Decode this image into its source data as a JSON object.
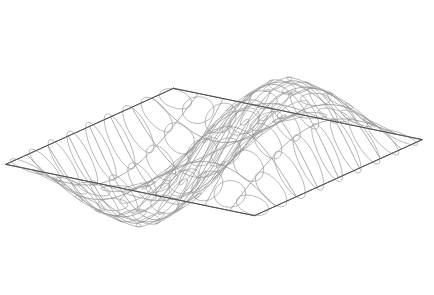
{
  "figure": {
    "title": "",
    "caption": "",
    "background_color": "#ffffff",
    "grid_stroke_color": "#8a8a8a",
    "boundary_stroke_color": "#4a4a4a",
    "ellipse_stroke_color": "#9a9a9a",
    "width": 434,
    "height": 295
  },
  "chart_data": {
    "type": "line",
    "title": "",
    "subtitle": "",
    "xlabel": "",
    "ylabel": "",
    "zlabel": "",
    "render_style": "wireframe-surface-with-curvature-ellipses",
    "surface": {
      "name": "sinusoidal saddle wave surface",
      "equation": "z = A * sin(pi * u) * cos(pi * v * 0.5)",
      "amplitude": 1.0,
      "u_range": [
        -1,
        1
      ],
      "v_range": [
        -1,
        1
      ],
      "u_divisions": 11,
      "v_divisions": 9
    },
    "projection": {
      "type": "axonometric",
      "azimuth_deg": 34,
      "elevation_deg": 21,
      "scale_x": 150,
      "scale_y": 128,
      "scale_z": 86,
      "origin_x": 214,
      "origin_y": 152
    },
    "ellipse_field": {
      "description": "curvature ellipses sampled on surface grid nodes",
      "count_u": 11,
      "count_v": 9,
      "base_radius_major": 0.115,
      "base_radius_minor": 0.055,
      "orientation_mode": "principal-direction"
    },
    "features": [
      {
        "name": "left crest",
        "pixel_x": 150,
        "pixel_y": 22
      },
      {
        "name": "left lower corner",
        "pixel_x": 38,
        "pixel_y": 222
      },
      {
        "name": "central trough",
        "pixel_x": 330,
        "pixel_y": 276
      },
      {
        "name": "right spike",
        "pixel_x": 402,
        "pixel_y": 70
      },
      {
        "name": "right lower corner",
        "pixel_x": 396,
        "pixel_y": 266
      }
    ],
    "axis_visible": false,
    "grid": false,
    "legend": false
  }
}
